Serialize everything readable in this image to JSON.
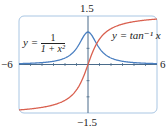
{
  "chart_data": {
    "type": "line",
    "title": "",
    "xlabel": "",
    "ylabel": "",
    "xlim": [
      -6,
      6
    ],
    "ylim": [
      -1.5,
      1.5
    ],
    "grid": false,
    "legend": "inline annotations",
    "tick_labels": {
      "x_min": "−6",
      "x_max": "6",
      "y_max": "1.5",
      "y_min": "−1.5"
    },
    "series": [
      {
        "name": "y = 1/(1 + x^2)",
        "color": "#4a7fc1",
        "x": [
          -6,
          -5,
          -4,
          -3,
          -2,
          -1,
          0,
          1,
          2,
          3,
          4,
          5,
          6
        ],
        "values": [
          0.027,
          0.038,
          0.059,
          0.1,
          0.2,
          0.5,
          1.0,
          0.5,
          0.2,
          0.1,
          0.059,
          0.038,
          0.027
        ]
      },
      {
        "name": "y = tan^-1 x",
        "color": "#d9604f",
        "x": [
          -6,
          -5,
          -4,
          -3,
          -2,
          -1,
          0,
          1,
          2,
          3,
          4,
          5,
          6
        ],
        "values": [
          -1.406,
          -1.373,
          -1.326,
          -1.249,
          -1.107,
          -0.785,
          0.0,
          0.785,
          1.107,
          1.249,
          1.326,
          1.373,
          1.406
        ]
      }
    ],
    "annotations": [
      {
        "text": "y = 1/(1 + x^2)",
        "position": "left"
      },
      {
        "text": "y = tan^-1 x",
        "position": "upper right"
      }
    ]
  },
  "labels": {
    "x_min": "−6",
    "x_max": "6",
    "y_max": "1.5",
    "y_min": "−1.5",
    "eq1_lhs": "y =",
    "eq1_num": "1",
    "eq1_den": "1 + x²",
    "eq2": "y = tan⁻¹ x"
  },
  "colors": {
    "frame": "#a9c6e3",
    "axis": "#4a6b8a",
    "series1": "#4a7fc1",
    "series2": "#d9604f"
  }
}
